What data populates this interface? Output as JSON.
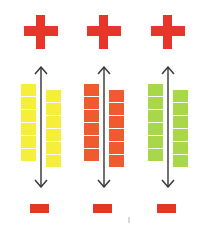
{
  "diagram": {
    "columns": [
      {
        "id": "yellow",
        "color": "#f5ee3a",
        "plus_symbol": "+",
        "minus_symbol": "−",
        "left_stack_count": 6,
        "right_stack_count": 6
      },
      {
        "id": "red",
        "color": "#ef5a2e",
        "plus_symbol": "+",
        "minus_symbol": "−",
        "left_stack_count": 6,
        "right_stack_count": 6
      },
      {
        "id": "green",
        "color": "#a8d84a",
        "plus_symbol": "+",
        "minus_symbol": "−",
        "left_stack_count": 6,
        "right_stack_count": 6
      }
    ],
    "symbol_color": "#e8352a",
    "arrow_color": "#333333",
    "arrow_type": "double-headed vertical"
  }
}
